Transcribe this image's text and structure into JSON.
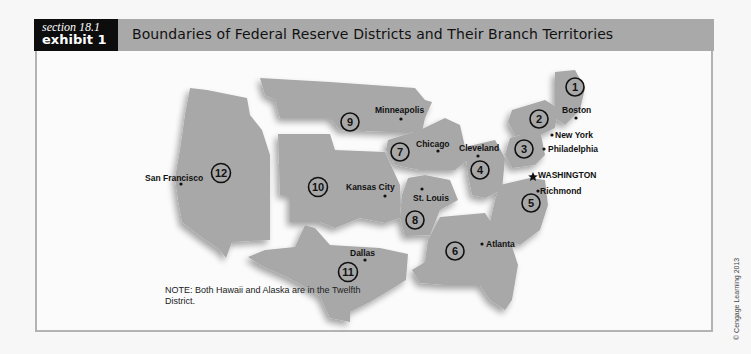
{
  "header": {
    "section": "section 18.1",
    "exhibit": "exhibit 1",
    "title": "Boundaries of Federal Reserve Districts and Their Branch Territories"
  },
  "colors": {
    "header_bar": "#a9a9a9",
    "exhibit_box": "#0d0d0d",
    "district_fill": "#a8a8a8",
    "frame_border": "#b3b3b3"
  },
  "districts": [
    {
      "number": "1",
      "city": "Boston"
    },
    {
      "number": "2",
      "city": "New York"
    },
    {
      "number": "3",
      "city": "Philadelphia"
    },
    {
      "number": "4",
      "city": "Cleveland"
    },
    {
      "number": "5",
      "city": "Richmond"
    },
    {
      "number": "6",
      "city": "Atlanta"
    },
    {
      "number": "7",
      "city": "Chicago"
    },
    {
      "number": "8",
      "city": "St. Louis"
    },
    {
      "number": "9",
      "city": "Minneapolis"
    },
    {
      "number": "10",
      "city": "Kansas City"
    },
    {
      "number": "11",
      "city": "Dallas"
    },
    {
      "number": "12",
      "city": "San Francisco"
    }
  ],
  "capital": {
    "label": "WASHINGTON",
    "icon": "star-icon"
  },
  "note": "NOTE: Both Hawaii and Alaska are in the Twelfth District.",
  "credit": "© Cengage Learning 2013"
}
